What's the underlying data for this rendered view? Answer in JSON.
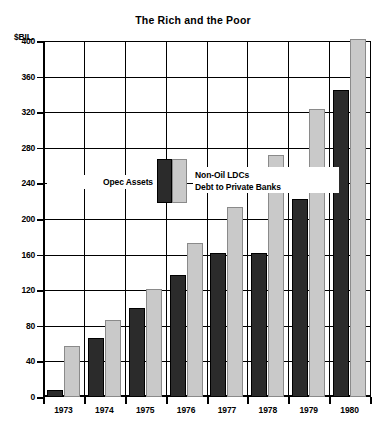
{
  "chart_data": {
    "type": "bar",
    "title": "The Rich and the Poor",
    "xlabel": "",
    "ylabel": "$BIL.",
    "ylim": [
      0,
      400
    ],
    "yticks": [
      0,
      40,
      80,
      120,
      160,
      200,
      240,
      280,
      320,
      360,
      400
    ],
    "grid": true,
    "legend_position": "inside-upper-left",
    "categories": [
      "1973",
      "1974",
      "1975",
      "1976",
      "1977",
      "1978",
      "1979",
      "1980"
    ],
    "series": [
      {
        "name": "Opec Assets",
        "color": "#2b2b2b",
        "values": [
          8,
          66,
          100,
          137,
          162,
          162,
          222,
          345
        ]
      },
      {
        "name": "Non-Oil LDCs Debt to Private Banks",
        "color": "#c9c9c9",
        "values": [
          57,
          86,
          121,
          173,
          213,
          272,
          324,
          402
        ]
      }
    ]
  },
  "legend": {
    "left_label": "Opec Assets",
    "right_label_line1": "Non-Oil LDCs",
    "right_label_line2": "Debt to Private Banks"
  },
  "axis": {
    "unit_label": "$BIL."
  }
}
